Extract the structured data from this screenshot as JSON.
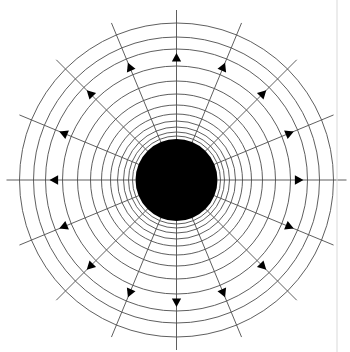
{
  "figure": {
    "type": "vector-field-diagram",
    "canvas": {
      "width": 350,
      "height": 352,
      "background": "#ffffff"
    },
    "colors": {
      "line": "#4d4d4d",
      "arrow": "#000000",
      "core": "#000000",
      "border": "#d9d9d9",
      "background": "#ffffff"
    },
    "center": {
      "x": 176.5,
      "y": 180
    },
    "core": {
      "name": "central-black-disk",
      "radius": 41,
      "fill": "#000000"
    },
    "equipotential_circles": {
      "name": "concentric-circles",
      "count": 12,
      "stroke": "#4d4d4d",
      "stroke_width": 0.9,
      "radii": [
        44,
        48,
        53,
        59,
        66,
        75,
        86,
        99,
        114,
        131,
        143,
        157
      ]
    },
    "radial_lines": {
      "name": "radial-field-lines",
      "count": 16,
      "angle_step_deg": 22.5,
      "start_angle_deg": 0,
      "inner_radius": 41,
      "outer_radius": 170,
      "stroke": "#4d4d4d",
      "stroke_width": 0.9
    },
    "arrowheads": {
      "name": "outward-direction-arrowheads",
      "count": 16,
      "radius": 122,
      "direction": "outward",
      "size": 8,
      "fill": "#000000"
    },
    "border": {
      "name": "right-edge-border",
      "x": 337,
      "stroke": "#d9d9d9",
      "stroke_width": 1
    }
  }
}
